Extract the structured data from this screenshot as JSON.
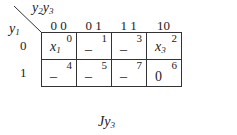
{
  "map": {
    "title": "Jy3",
    "title_main": "Jy",
    "title_sub": "3",
    "corner": {
      "col_var_main1": "y",
      "col_var_sub1": "2",
      "col_var_main2": "y",
      "col_var_sub2": "3",
      "row_var_main": "y",
      "row_var_sub": "1"
    },
    "columns": [
      "0 0",
      "0 1",
      "1 1",
      "10"
    ],
    "rows": [
      {
        "label": "0",
        "cells": [
          {
            "index": "0",
            "value_main": "x",
            "value_sub": "1"
          },
          {
            "index": "1",
            "value_main": "–",
            "value_sub": ""
          },
          {
            "index": "3",
            "value_main": "–",
            "value_sub": ""
          },
          {
            "index": "2",
            "value_main": "x",
            "value_sub": "3"
          }
        ]
      },
      {
        "label": "1",
        "cells": [
          {
            "index": "4",
            "value_main": "–",
            "value_sub": ""
          },
          {
            "index": "5",
            "value_main": "–",
            "value_sub": ""
          },
          {
            "index": "7",
            "value_main": "–",
            "value_sub": ""
          },
          {
            "index": "6",
            "value_main": "0",
            "value_sub": ""
          }
        ]
      }
    ]
  }
}
